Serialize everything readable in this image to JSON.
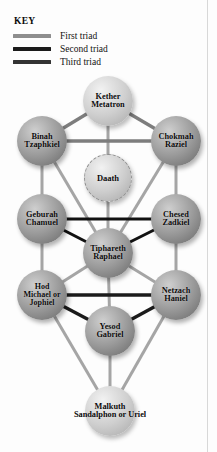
{
  "figure": {
    "type": "kabbalah-tree-of-life",
    "background_color": "#fdfdfd"
  },
  "key": {
    "title": "KEY",
    "items": [
      {
        "label": "First triad",
        "color": "#8e8e8e",
        "style": "thick-gray-line"
      },
      {
        "label": "Second triad",
        "color": "#1b1b1b",
        "style": "thick-black-line"
      },
      {
        "label": "Third triad",
        "color": "#333333",
        "style": "thick-dark-line"
      }
    ]
  },
  "tree": {
    "nodes": [
      {
        "id": "kether",
        "lines": [
          "Kether",
          "Metatron"
        ],
        "cx": 108,
        "cy": 101,
        "r": 25,
        "style": "sphere-light",
        "font": 8.3
      },
      {
        "id": "binah",
        "lines": [
          "Binah",
          "Tzaphkiel"
        ],
        "cx": 42,
        "cy": 141,
        "r": 25,
        "style": "sphere",
        "font": 8.3
      },
      {
        "id": "chokmah",
        "lines": [
          "Chokmah",
          "Raziel"
        ],
        "cx": 176,
        "cy": 141,
        "r": 25,
        "style": "sphere",
        "font": 8.3
      },
      {
        "id": "daath",
        "lines": [
          "Daath"
        ],
        "cx": 108,
        "cy": 178,
        "r": 24,
        "style": "sphere-light dashed-ring",
        "font": 8.5
      },
      {
        "id": "geburah",
        "lines": [
          "Geburah",
          "Chamuel"
        ],
        "cx": 42,
        "cy": 219,
        "r": 25,
        "style": "sphere",
        "font": 8.3
      },
      {
        "id": "chesed",
        "lines": [
          "Chesed",
          "Zadkiel"
        ],
        "cx": 176,
        "cy": 219,
        "r": 25,
        "style": "sphere",
        "font": 8.3
      },
      {
        "id": "tiphareth",
        "lines": [
          "Tiphareth",
          "Raphael"
        ],
        "cx": 108,
        "cy": 253,
        "r": 25,
        "style": "sphere",
        "font": 8.3
      },
      {
        "id": "hod",
        "lines": [
          "Hod",
          "Michael or",
          "Jophiel"
        ],
        "cx": 42,
        "cy": 295,
        "r": 25,
        "style": "sphere",
        "font": 8.0
      },
      {
        "id": "netzach",
        "lines": [
          "Netzach",
          "Haniel"
        ],
        "cx": 176,
        "cy": 295,
        "r": 25,
        "style": "sphere",
        "font": 8.3
      },
      {
        "id": "yesod",
        "lines": [
          "Yesod",
          "Gabriel"
        ],
        "cx": 110,
        "cy": 331,
        "r": 25,
        "style": "sphere",
        "font": 8.3
      },
      {
        "id": "malkuth",
        "lines": [
          "Malkuth",
          "Sandalphon or Uriel"
        ],
        "cx": 110,
        "cy": 411,
        "r": 25,
        "style": "sphere-light",
        "font": 8.3
      }
    ],
    "paths": [
      {
        "from": "kether",
        "to": "binah",
        "triad": 1
      },
      {
        "from": "kether",
        "to": "chokmah",
        "triad": 1
      },
      {
        "from": "binah",
        "to": "chokmah",
        "triad": 1
      },
      {
        "from": "kether",
        "to": "tiphareth",
        "triad": 0
      },
      {
        "from": "binah",
        "to": "geburah",
        "triad": 0
      },
      {
        "from": "chokmah",
        "to": "chesed",
        "triad": 0
      },
      {
        "from": "binah",
        "to": "tiphareth",
        "triad": 0
      },
      {
        "from": "chokmah",
        "to": "tiphareth",
        "triad": 0
      },
      {
        "from": "geburah",
        "to": "chesed",
        "triad": 2
      },
      {
        "from": "geburah",
        "to": "tiphareth",
        "triad": 2
      },
      {
        "from": "chesed",
        "to": "tiphareth",
        "triad": 2
      },
      {
        "from": "geburah",
        "to": "hod",
        "triad": 0
      },
      {
        "from": "chesed",
        "to": "netzach",
        "triad": 0
      },
      {
        "from": "tiphareth",
        "to": "hod",
        "triad": 0
      },
      {
        "from": "tiphareth",
        "to": "netzach",
        "triad": 0
      },
      {
        "from": "tiphareth",
        "to": "yesod",
        "triad": 0
      },
      {
        "from": "hod",
        "to": "netzach",
        "triad": 3
      },
      {
        "from": "hod",
        "to": "yesod",
        "triad": 3
      },
      {
        "from": "netzach",
        "to": "yesod",
        "triad": 3
      },
      {
        "from": "hod",
        "to": "malkuth",
        "triad": 0
      },
      {
        "from": "netzach",
        "to": "malkuth",
        "triad": 0
      },
      {
        "from": "yesod",
        "to": "malkuth",
        "triad": 0
      }
    ],
    "colors": {
      "plain_path": "#a5a5a5",
      "triad_1": "#7d7d7d",
      "triad_2": "#121212",
      "triad_3": "#1b1b1b"
    }
  }
}
